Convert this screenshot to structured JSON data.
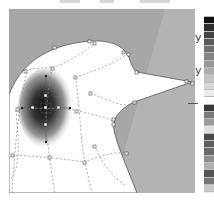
{
  "canvas": {
    "background_color": "#a7a7a7",
    "highlight_band_color": "#b5b5b5",
    "shape_fill": "#ffffff",
    "mesh_line_color": "#888888",
    "gradient_center_color": "#111111"
  },
  "palette": {
    "none_swatch": "none-icon",
    "swatches": [
      "#111111",
      "#2d2d2d",
      "#444444",
      "#5a5a5a",
      "#6f6f6f",
      "#848484",
      "#999999",
      "#adadad",
      "#c2c2c2",
      "#d6d6d6",
      "#ebebeb",
      "#ffffff",
      "#3a3a3a",
      "#7a7a7a",
      "#9a9a9a",
      "#e0e0e0",
      "#4b4b4b",
      "#5e5e5e",
      "#6a6a6a",
      "#8e8e8e",
      "#b0b0b0",
      "#555555",
      "#767676",
      "#c8c8c8"
    ]
  },
  "side_glyphs": [
    "y",
    "y"
  ],
  "caption": ""
}
